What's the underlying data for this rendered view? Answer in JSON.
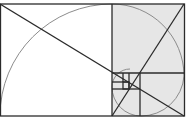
{
  "diagram": {
    "type": "golden-rectangle-spiral",
    "width": 188,
    "height": 119,
    "colors": {
      "background": "#ffffff",
      "shaded_region": "#e6e6e6",
      "lines": "#2b2b2b",
      "arcs": "#8c8c8c"
    },
    "outer_rect": {
      "x": 0,
      "y": 4,
      "w": 184,
      "h": 112
    },
    "squares": [
      {
        "x": 0,
        "y": 4,
        "s": 112
      },
      {
        "x": 112,
        "y": 4,
        "s": 72
      },
      {
        "x": 141,
        "y": 76,
        "s": 43
      },
      {
        "x": 112,
        "y": 87,
        "s": 29
      },
      {
        "x": 112,
        "y": 76,
        "s": 11
      },
      {
        "x": 123,
        "y": 76,
        "s": 18
      }
    ],
    "shaded_rect": {
      "x": 112,
      "y": 4,
      "w": 72,
      "h": 112
    },
    "diagonals": [
      {
        "x1": 0,
        "y1": 4,
        "x2": 184,
        "y2": 116
      },
      {
        "x1": 112,
        "y1": 116,
        "x2": 184,
        "y2": 4
      }
    ]
  }
}
